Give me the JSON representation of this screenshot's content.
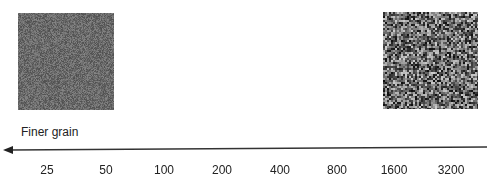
{
  "swatches": [
    {
      "id": "fine",
      "grain": "fine",
      "mean_gray": "#6a6a6a"
    },
    {
      "id": "coarse",
      "grain": "coarse",
      "mean_gray": "#707070"
    }
  ],
  "axis": {
    "label": "Finer grain",
    "direction": "left",
    "line_color": "#333333",
    "ticks": [
      "25",
      "50",
      "100",
      "200",
      "400",
      "800",
      "1600",
      "3200"
    ]
  }
}
